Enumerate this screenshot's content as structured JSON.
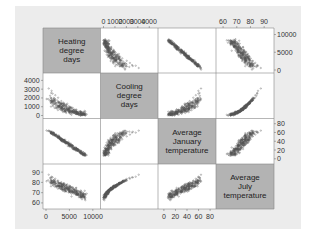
{
  "chart_data": {
    "type": "scatter",
    "subtype": "scatterplot-matrix",
    "title": "",
    "variables": [
      "Heating degree days",
      "Cooling degree days",
      "Average January temperature",
      "Average July temperature"
    ],
    "diagonal_labels": [
      [
        "Heating",
        "degree",
        "days"
      ],
      [
        "Cooling",
        "degree",
        "days"
      ],
      [
        "Average",
        "January",
        "temperature"
      ],
      [
        "Average",
        "July",
        "temperature"
      ]
    ],
    "axes": {
      "heating_degree_days": {
        "range": [
          0,
          11000
        ],
        "ticks": [
          "0",
          "5000",
          "10000"
        ]
      },
      "cooling_degree_days": {
        "range": [
          0,
          4500
        ],
        "ticks": [
          "0",
          "1000",
          "2000",
          "3000",
          "4000"
        ]
      },
      "average_january_temperature": {
        "range": [
          -5,
          85
        ],
        "ticks": [
          "0",
          "20",
          "40",
          "60",
          "80"
        ]
      },
      "average_july_temperature": {
        "range": [
          57,
          95
        ],
        "ticks": [
          "60",
          "70",
          "80",
          "90"
        ]
      }
    },
    "tick_placement": {
      "top": {
        "col1": [
          "0",
          "1000",
          "2000",
          "3000",
          "4000"
        ],
        "col3": [
          "60",
          "70",
          "80",
          "90"
        ]
      },
      "right": {
        "row0": [
          "0",
          "5000",
          "10000"
        ],
        "row2": [
          "0",
          "20",
          "40",
          "60",
          "80"
        ]
      },
      "left": {
        "row1": [
          "0",
          "1000",
          "2000",
          "3000",
          "4000"
        ],
        "row3": [
          "60",
          "70",
          "80",
          "90"
        ]
      },
      "bottom": {
        "col0": [
          "0",
          "5000",
          "10000"
        ],
        "col2": [
          "0",
          "20",
          "40",
          "60",
          "80"
        ]
      }
    },
    "relationships": [
      {
        "x": "Cooling degree days",
        "y": "Heating degree days",
        "trend": "strong negative, convex"
      },
      {
        "x": "Average January temperature",
        "y": "Heating degree days",
        "trend": "strong negative, near linear"
      },
      {
        "x": "Average July temperature",
        "y": "Heating degree days",
        "trend": "negative"
      },
      {
        "x": "Average January temperature",
        "y": "Cooling degree days",
        "trend": "positive, convex"
      },
      {
        "x": "Average July temperature",
        "y": "Cooling degree days",
        "trend": "strong positive, convex"
      },
      {
        "x": "Average July temperature",
        "y": "Average January temperature",
        "trend": "positive"
      }
    ],
    "grid": false,
    "legend": null
  }
}
